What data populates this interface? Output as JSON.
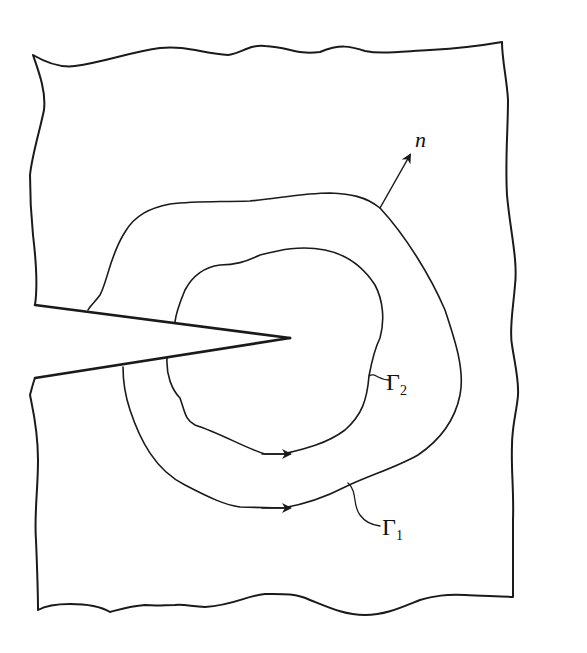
{
  "diagram": {
    "labels": {
      "normal": "n",
      "contour_outer": {
        "symbol": "Γ",
        "subscript": "1"
      },
      "contour_inner": {
        "symbol": "Γ",
        "subscript": "2"
      }
    },
    "colors": {
      "line": "#1a1a1a",
      "background": "#ffffff"
    }
  }
}
